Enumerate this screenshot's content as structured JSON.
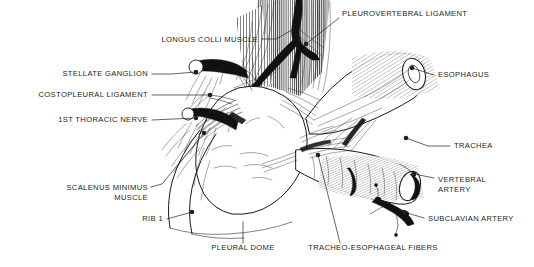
{
  "figure": {
    "style": "pen-and-ink line drawing",
    "background_color": "#ffffff",
    "ink_color": "#231f20",
    "width": 534,
    "height": 267
  },
  "labels": [
    {
      "id": "longus-colli-muscle",
      "text": "LONGUS COLLI MUSCLE",
      "align": "end",
      "text_x": 258,
      "text_y": 42,
      "leader": "M262,39 L276,39 L292,30",
      "dot": null
    },
    {
      "id": "pleurovertebral-ligament",
      "text": "PLEUROVERTEBRAL LIGAMENT",
      "align": "start",
      "text_x": 342,
      "text_y": 16,
      "leader": "M339,18 L306,44",
      "dot": [
        306,
        44
      ]
    },
    {
      "id": "esophagus",
      "text": "ESOPHAGUS",
      "align": "start",
      "text_x": 438,
      "text_y": 77,
      "leader": "M434,75 L412,68",
      "dot": [
        412,
        68
      ]
    },
    {
      "id": "stellate-ganglion",
      "text": "STELLATE GANGLION",
      "align": "end",
      "text_x": 148,
      "text_y": 76,
      "leader": "M152,74 L172,74 L196,72",
      "dot": [
        196,
        72
      ]
    },
    {
      "id": "costopleural-ligament",
      "text": "COSTOPLEURAL LIGAMENT",
      "align": "end",
      "text_x": 148,
      "text_y": 97,
      "leader": "M152,95 L210,95",
      "dot": [
        210,
        95
      ]
    },
    {
      "id": "first-thoracic-nerve",
      "text": "1ST THORACIC NERVE",
      "align": "end",
      "text_x": 148,
      "text_y": 122,
      "leader": "M152,120 L196,118",
      "dot": [
        196,
        118
      ]
    },
    {
      "id": "trachea",
      "text": "TRACHEA",
      "align": "start",
      "text_x": 454,
      "text_y": 148,
      "leader": "M450,146 L428,146 L406,138",
      "dot": [
        406,
        138
      ]
    },
    {
      "id": "vertebral-artery",
      "text": "VERTEBRAL",
      "text_line2": "ARTERY",
      "align": "start",
      "text_x": 438,
      "text_y": 182,
      "text_y2": 192,
      "leader": "M434,178 L414,174",
      "dot": [
        414,
        174
      ]
    },
    {
      "id": "subclavian-artery",
      "text": "SUBCLAVIAN ARTERY",
      "align": "start",
      "text_x": 428,
      "text_y": 221,
      "leader": "M424,218 L404,212",
      "dot": [
        404,
        212
      ]
    },
    {
      "id": "scalenus-minimus-muscle",
      "text": "SCALENUS MINIMUS",
      "text_line2": "MUSCLE",
      "align": "end",
      "text_x": 148,
      "text_y": 190,
      "text_y2": 200,
      "leader": "M151,187 L162,184 L204,133",
      "dot": [
        204,
        133
      ]
    },
    {
      "id": "rib-1",
      "text": "RIB 1",
      "align": "end",
      "text_x": 163,
      "text_y": 221,
      "leader": "M167,219 L192,212",
      "dot": [
        192,
        212
      ]
    },
    {
      "id": "pleural-dome",
      "text": "PLEURAL DOME",
      "align": "middle",
      "text_x": 243,
      "text_y": 250,
      "leader": "M243,243 L243,222",
      "dot": null
    },
    {
      "id": "tracheo-esophageal-fibers",
      "text": "TRACHEO-ESOPHAGEAL FIBERS",
      "align": "middle",
      "text_x": 373,
      "text_y": 250,
      "leader": "M340,243 L318,155",
      "dot": [
        318,
        155
      ]
    }
  ],
  "structures": [
    {
      "id": "pleural-dome-body",
      "name": "pleural dome",
      "kind": "dome"
    },
    {
      "id": "rib-1-band",
      "name": "first rib",
      "kind": "curved-band"
    },
    {
      "id": "longus-colli-hatch",
      "name": "longus colli muscle",
      "kind": "vertical-hatch"
    },
    {
      "id": "pleurovertebral-ligament-shape",
      "name": "pleurovertebral ligament",
      "kind": "dark-branch"
    },
    {
      "id": "esophagus-tube",
      "name": "esophagus",
      "kind": "cylinder"
    },
    {
      "id": "trachea-tube",
      "name": "trachea",
      "kind": "cylinder"
    },
    {
      "id": "stellate-ganglion-shape",
      "name": "stellate ganglion",
      "kind": "dark-ganglion"
    },
    {
      "id": "first-thoracic-nerve-shape",
      "name": "1st thoracic nerve",
      "kind": "dark-nerve"
    },
    {
      "id": "subclavian-artery-shape",
      "name": "subclavian artery",
      "kind": "dark-vessel"
    },
    {
      "id": "vertebral-artery-shape",
      "name": "vertebral artery",
      "kind": "dark-vessel"
    },
    {
      "id": "tracheo-esophageal-fibers-shape",
      "name": "tracheo-esophageal fibers",
      "kind": "fiber-fan"
    },
    {
      "id": "scalenus-minimus-shape",
      "name": "scalenus minimus muscle",
      "kind": "fiber-fan"
    }
  ]
}
